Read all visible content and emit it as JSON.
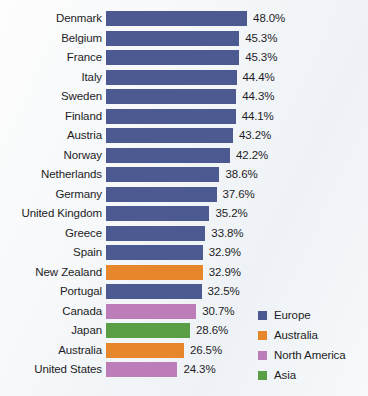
{
  "chart_data": {
    "type": "bar",
    "orientation": "horizontal",
    "title": "",
    "subtitle": "",
    "xlabel": "",
    "ylabel": "",
    "grid": false,
    "xlim": [
      0,
      48.0
    ],
    "value_suffix": "%",
    "categories": [
      "Denmark",
      "Belgium",
      "France",
      "Italy",
      "Sweden",
      "Finland",
      "Austria",
      "Norway",
      "Netherlands",
      "Germany",
      "United Kingdom",
      "Greece",
      "Spain",
      "New Zealand",
      "Portugal",
      "Canada",
      "Japan",
      "Australia",
      "United States"
    ],
    "values": [
      48.0,
      45.3,
      45.3,
      44.4,
      44.3,
      44.1,
      43.2,
      42.2,
      38.6,
      37.6,
      35.2,
      33.8,
      32.9,
      32.9,
      32.5,
      30.7,
      28.6,
      26.5,
      24.3
    ],
    "value_labels": [
      "48.0%",
      "45.3%",
      "45.3%",
      "44.4%",
      "44.3%",
      "44.1%",
      "43.2%",
      "42.2%",
      "38.6%",
      "37.6%",
      "35.2%",
      "33.8%",
      "32.9%",
      "32.9%",
      "32.5%",
      "30.7%",
      "28.6%",
      "26.5%",
      "24.3%"
    ],
    "groups": [
      "Europe",
      "Europe",
      "Europe",
      "Europe",
      "Europe",
      "Europe",
      "Europe",
      "Europe",
      "Europe",
      "Europe",
      "Europe",
      "Europe",
      "Europe",
      "Australia",
      "Europe",
      "North America",
      "Asia",
      "Australia",
      "North America"
    ],
    "group_colors": {
      "Europe": "#4c5a91",
      "Australia": "#e8862c",
      "North America": "#bc7db8",
      "Asia": "#5a9e45"
    },
    "legend": {
      "position": "bottom-right",
      "items": [
        {
          "label": "Europe",
          "color": "#4c5a91"
        },
        {
          "label": "Australia",
          "color": "#e8862c"
        },
        {
          "label": "North America",
          "color": "#bc7db8"
        },
        {
          "label": "Asia",
          "color": "#5a9e45"
        }
      ]
    }
  }
}
